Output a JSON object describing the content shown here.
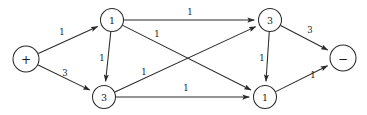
{
  "figure": {
    "background_color": "#ffffff",
    "stroke_color": "#2a2a2a",
    "text_color": "#1a1a1a"
  },
  "nodes": [
    {
      "id": "source",
      "label": "+",
      "kind": "terminal",
      "cx": 26,
      "cy": 59,
      "r": 13
    },
    {
      "id": "upper-left",
      "label": "1",
      "kind": "internal",
      "cx": 112,
      "cy": 20,
      "r": 11.5
    },
    {
      "id": "lower-left",
      "label": "3",
      "kind": "internal",
      "cx": 104,
      "cy": 97,
      "r": 11.5
    },
    {
      "id": "upper-right",
      "label": "3",
      "kind": "internal",
      "cx": 270,
      "cy": 20,
      "r": 11.5
    },
    {
      "id": "lower-right",
      "label": "1",
      "kind": "internal",
      "cx": 265,
      "cy": 97,
      "r": 11.5
    },
    {
      "id": "sink",
      "label": "−",
      "kind": "terminal",
      "cx": 343,
      "cy": 58,
      "r": 13
    }
  ],
  "edges": [
    {
      "id": "source-to-upper-left",
      "from": "source",
      "to": "upper-left",
      "label": "1",
      "label_x": 62,
      "label_y": 32
    },
    {
      "id": "source-to-lower-left",
      "from": "source",
      "to": "lower-left",
      "label": "3",
      "label_x": 65,
      "label_y": 73
    },
    {
      "id": "upper-left-to-lower-left",
      "from": "upper-left",
      "to": "lower-left",
      "label": "1",
      "label_x": 102,
      "label_y": 58
    },
    {
      "id": "upper-left-to-upper-right",
      "from": "upper-left",
      "to": "upper-right",
      "label": "1",
      "label_x": 190,
      "label_y": 12
    },
    {
      "id": "upper-left-to-lower-right",
      "from": "upper-left",
      "to": "lower-right",
      "label": "1",
      "label_x": 157,
      "label_y": 34
    },
    {
      "id": "lower-left-to-upper-right",
      "from": "lower-left",
      "to": "upper-right",
      "label": "1",
      "label_x": 144,
      "label_y": 72
    },
    {
      "id": "lower-left-to-lower-right",
      "from": "lower-left",
      "to": "lower-right",
      "label": "1",
      "label_x": 186,
      "label_y": 88
    },
    {
      "id": "upper-right-to-lower-right",
      "from": "upper-right",
      "to": "lower-right",
      "label": "1",
      "label_x": 262,
      "label_y": 58
    },
    {
      "id": "upper-right-to-sink",
      "from": "upper-right",
      "to": "sink",
      "label": "3",
      "label_x": 310,
      "label_y": 30
    },
    {
      "id": "lower-right-to-sink",
      "from": "lower-right",
      "to": "sink",
      "label": "1",
      "label_x": 313,
      "label_y": 75
    }
  ]
}
